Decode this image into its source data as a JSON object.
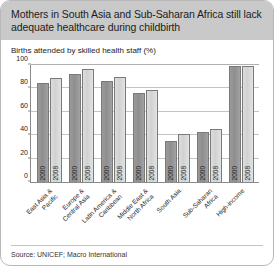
{
  "card": {
    "title": "Mothers in South Asia and Sub-Saharan Africa still lack adequate healthcare during childbirth",
    "source": "Source: UNICEF; Macro International"
  },
  "chart_data": {
    "type": "bar",
    "title": "Births attended by skilled health staff (%)",
    "xlabel": "",
    "ylabel": "",
    "ylim": [
      0,
      100
    ],
    "yticks": [
      0,
      20,
      40,
      60,
      80,
      100
    ],
    "grid": true,
    "legend": "none",
    "categories": [
      "East Asia &\nPacific",
      "Europe &\nCentral Asia",
      "Latin America &\nCaribbean",
      "Middle East &\nNorth Africa",
      "South Asia",
      "Sub-Saharan\nAfrica",
      "High-income"
    ],
    "category_lines": [
      [
        "East Asia &",
        "Pacific"
      ],
      [
        "Europe &",
        "Central Asia"
      ],
      [
        "Latin America &",
        "Caribbean"
      ],
      [
        "Middle East &",
        "North Africa"
      ],
      [
        "South Asia"
      ],
      [
        "Sub-Saharan",
        "Africa"
      ],
      [
        "High-income"
      ]
    ],
    "series": [
      {
        "name": "2000",
        "color": "#8e8e8e",
        "values": [
          85,
          92,
          86,
          76,
          35,
          43,
          99
        ]
      },
      {
        "name": "2008",
        "color": "#d6d6d6",
        "values": [
          89,
          97,
          90,
          79,
          41,
          45,
          99
        ]
      }
    ]
  }
}
